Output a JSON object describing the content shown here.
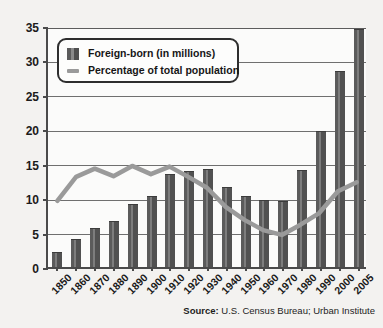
{
  "chart_data": {
    "type": "bar",
    "title": "",
    "subtitle": "",
    "xlabel": "",
    "ylabel": "",
    "ylim": [
      0,
      35
    ],
    "yticks": [
      0,
      5,
      10,
      15,
      20,
      25,
      30,
      35
    ],
    "grid": true,
    "legend_position": "top-left-inside",
    "categories": [
      "1850",
      "1860",
      "1870",
      "1880",
      "1890",
      "1900",
      "1910",
      "1920",
      "1930",
      "1940",
      "1950",
      "1960",
      "1970",
      "1980",
      "1990",
      "2000",
      "2005"
    ],
    "series": [
      {
        "name": "Foreign-born (in millions)",
        "type": "bar",
        "color": "#5b5b5b",
        "values": [
          2.2,
          4.1,
          5.6,
          6.7,
          9.2,
          10.3,
          13.5,
          13.9,
          14.2,
          11.6,
          10.3,
          9.7,
          9.6,
          14.1,
          19.8,
          28.4,
          34.5
        ]
      },
      {
        "name": "Percentage of total population",
        "type": "line",
        "color": "#9a9a9a",
        "values": [
          9.7,
          13.2,
          14.4,
          13.3,
          14.8,
          13.6,
          14.7,
          13.2,
          11.6,
          8.8,
          6.9,
          5.4,
          4.7,
          6.2,
          7.9,
          11.1,
          12.4
        ]
      }
    ],
    "annotations": [
      "Source: U.S. Census Bureau; Urban Institute"
    ]
  },
  "legend": {
    "bar_label": "Foreign-born (in millions)",
    "line_label": "Percentage of total population"
  },
  "source": {
    "label": "Source:",
    "text": " U.S. Census Bureau; Urban Institute"
  },
  "colors": {
    "bar": "#5b5b5b",
    "line": "#9a9a9a",
    "axis": "#4a4a4a",
    "grid": "#6f6f6f",
    "background": "#f3f2f0",
    "plot_background": "#fbfbfa"
  }
}
